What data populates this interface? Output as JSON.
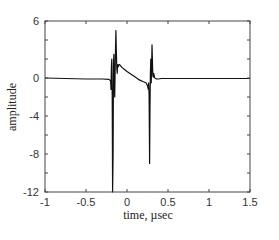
{
  "chart_data": {
    "type": "line",
    "title": "",
    "xlabel": "time, µsec",
    "ylabel": "amplitude",
    "xlim": [
      -1,
      1.5
    ],
    "ylim": [
      -12,
      6
    ],
    "xticks": [
      -1,
      -0.5,
      0,
      0.5,
      1,
      1.5
    ],
    "xtick_labels": [
      "-1",
      "-0.5",
      "0",
      "0.5",
      "1",
      "1.5"
    ],
    "yticks": [
      -12,
      -8,
      -4,
      0,
      6
    ],
    "ytick_labels": [
      "-12",
      "-8",
      "-4",
      "0",
      "6"
    ],
    "grid": false,
    "legend": null,
    "series": [
      {
        "name": "signal",
        "color": "#111111",
        "x": [
          -1.0,
          -0.5,
          -0.3,
          -0.22,
          -0.2,
          -0.195,
          -0.19,
          -0.185,
          -0.18,
          -0.175,
          -0.17,
          -0.165,
          -0.16,
          -0.155,
          -0.15,
          -0.145,
          -0.14,
          -0.135,
          -0.13,
          -0.125,
          -0.12,
          -0.115,
          -0.11,
          -0.105,
          -0.1,
          -0.09,
          -0.08,
          -0.06,
          -0.03,
          0.0,
          0.05,
          0.1,
          0.15,
          0.2,
          0.23,
          0.25,
          0.26,
          0.265,
          0.27,
          0.275,
          0.28,
          0.285,
          0.29,
          0.295,
          0.3,
          0.305,
          0.31,
          0.315,
          0.32,
          0.325,
          0.33,
          0.335,
          0.34,
          0.345,
          0.35,
          0.36,
          0.38,
          0.42,
          0.5,
          0.7,
          1.0,
          1.3,
          1.5
        ],
        "y": [
          0.0,
          -0.1,
          -0.1,
          -0.15,
          -0.3,
          -1.2,
          1.2,
          2.0,
          -1.5,
          -12.0,
          -8.0,
          1.5,
          2.5,
          -0.5,
          -2.0,
          0.5,
          3.0,
          5.0,
          3.0,
          1.0,
          0.5,
          1.4,
          1.3,
          1.2,
          1.4,
          1.4,
          1.3,
          1.1,
          0.9,
          0.7,
          0.4,
          0.1,
          -0.2,
          -0.4,
          -0.5,
          -0.8,
          -1.2,
          -0.5,
          -1.8,
          -9.0,
          -3.0,
          0.5,
          2.0,
          -0.5,
          1.0,
          3.5,
          2.0,
          0.3,
          0.1,
          0.5,
          0.3,
          0.1,
          0.0,
          -0.05,
          -0.05,
          -0.1,
          -0.1,
          -0.05,
          -0.05,
          -0.05,
          -0.05,
          -0.05,
          -0.05
        ]
      }
    ]
  }
}
